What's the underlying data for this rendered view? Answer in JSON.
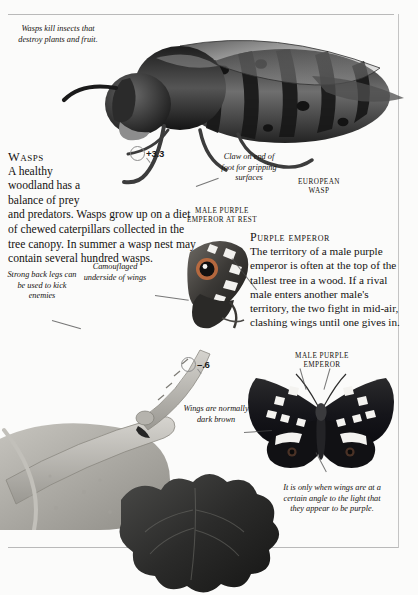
{
  "page": {
    "background_color": "#fbfbfa",
    "text_color": "#141210",
    "rule_color": "#b9b9b9"
  },
  "captions": {
    "wasps_kill": "Wasps kill insects that destroy plants and fruit.",
    "claw": "Claw on end of foot for gripping surfaces",
    "camouflaged": "Camouflaged underside of wings",
    "strong_legs": "Strong back legs can be used to kick enemies",
    "wings_brown": "Wings are normally dark brown",
    "angle_purple": "It is only when wings are at a certain angle to the light that they appear to be purple."
  },
  "labels": {
    "european_wasp": "European wasp",
    "male_pe_at_rest": "Male purple emperor at rest",
    "male_pe": "Male purple emperor"
  },
  "articles": {
    "wasps": {
      "heading": "Wasps",
      "line1": "A healthy",
      "line2": "woodland has a",
      "line3": "balance of prey",
      "rest": "and predators. Wasps grow up on a diet of chewed caterpillars collected in the tree canopy. In summer a wasp nest may contain several hundred wasps."
    },
    "purple_emperor": {
      "heading": "Purple emperor",
      "body": "The territory of a male purple emperor is often at the top of the tallest tree in a wood. If a rival male enters another male's territory, the two fight in mid-air, clashing wings until one gives in."
    }
  },
  "magnifiers": [
    {
      "name": "wasp-scale",
      "value": "+3.3"
    },
    {
      "name": "butterfly-scale",
      "value": "–.6"
    }
  ]
}
